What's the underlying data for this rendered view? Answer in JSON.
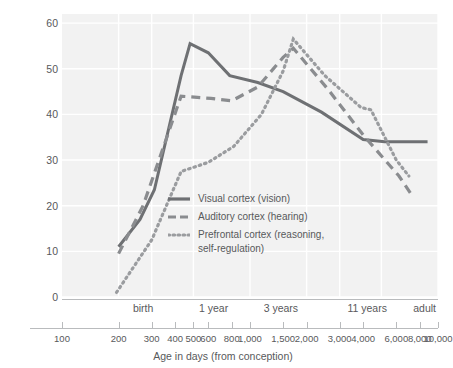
{
  "chart_data": {
    "type": "line",
    "title": "",
    "xlabel": "Age in days (from conception)",
    "ylabel": "Synaptic density",
    "x_scale": "log",
    "xlim": [
      100,
      10000
    ],
    "ylim": [
      0,
      62
    ],
    "grid": true,
    "legend_position": "inside-center",
    "y_ticks": [
      0,
      10,
      20,
      30,
      40,
      50,
      60
    ],
    "x_ticks": [
      100,
      200,
      300,
      400,
      500,
      600,
      800,
      1000,
      1500,
      2000,
      3000,
      4000,
      6000,
      8000,
      10000
    ],
    "x_tick_labels": [
      "100",
      "200",
      "300",
      "400",
      "500",
      "600",
      "800",
      "1,000",
      "1,500",
      "2,000",
      "3,000",
      "4,000",
      "6,000",
      "8,000",
      "10,000"
    ],
    "x_category_ticks": [
      270,
      640,
      1460,
      4200,
      10000
    ],
    "x_category_labels": [
      "birth",
      "1 year",
      "3 years",
      "11 years",
      "adult"
    ],
    "series": [
      {
        "name": "Visual cortex (vision)",
        "style": "solid",
        "color": "#6e7073",
        "x": [
          200,
          260,
          310,
          430,
          480,
          600,
          780,
          1100,
          1500,
          2400,
          4000,
          5200,
          8800
        ],
        "y": [
          11.0,
          17.0,
          23.5,
          48.5,
          55.5,
          53.5,
          48.5,
          47.0,
          45.0,
          40.5,
          34.5,
          34.0,
          34.0
        ]
      },
      {
        "name": "Auditory cortex (hearing)",
        "style": "dashed",
        "color": "#8a8c8f",
        "x": [
          200,
          270,
          430,
          620,
          800,
          1100,
          1500,
          1700,
          2600,
          4000,
          6200,
          7200
        ],
        "y": [
          9.5,
          20.0,
          44.0,
          43.5,
          43.0,
          46.0,
          52.5,
          54.5,
          45.5,
          35.5,
          26.5,
          22.5
        ]
      },
      {
        "name": "Prefrontal cortex (reasoning, self-regulation)",
        "style": "dotted",
        "color": "#9a9c9f",
        "x": [
          195,
          300,
          430,
          600,
          820,
          1150,
          1500,
          1700,
          2500,
          3900,
          4400,
          6000,
          7000
        ],
        "y": [
          1.0,
          12.5,
          27.5,
          29.5,
          33.0,
          40.0,
          49.5,
          56.5,
          48.5,
          41.5,
          41.0,
          30.0,
          26.5
        ]
      }
    ]
  },
  "axis": {
    "ylabel": "Synaptic density",
    "xlabel": "Age in days (from conception)"
  },
  "legend": {
    "items": [
      {
        "label": "Visual cortex (vision)",
        "style": "solid"
      },
      {
        "label": "Auditory cortex (hearing)",
        "style": "dashed"
      },
      {
        "label": "Prefrontal cortex (reasoning,\nself-regulation)",
        "style": "dotted"
      }
    ]
  },
  "colors": {
    "plot_background": "#f2f2f2",
    "grid": "#ffffff",
    "text": "#58595b",
    "axis": "#b9bbbd",
    "solid_line": "#6e7073",
    "dashed_line": "#8a8c8f",
    "dotted_line": "#9a9c9f"
  }
}
